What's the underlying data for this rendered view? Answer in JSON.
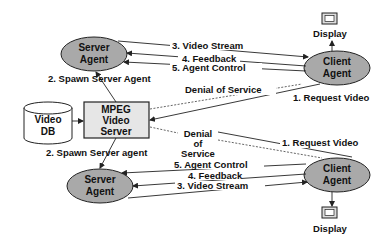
{
  "diagram": {
    "nodes": {
      "server_agent_top": {
        "line1": "Server",
        "line2": "Agent"
      },
      "client_agent_top": {
        "line1": "Client",
        "line2": "Agent"
      },
      "server_agent_bottom": {
        "line1": "Server",
        "line2": "Agent"
      },
      "client_agent_bottom": {
        "line1": "Client",
        "line2": "Agent"
      },
      "mpeg_server": {
        "line1": "MPEG",
        "line2": "Video",
        "line3": "Server"
      },
      "video_db": {
        "line1": "Video",
        "line2": "DB"
      },
      "display_top": {
        "label": "Display"
      },
      "display_bottom": {
        "label": "Display"
      }
    },
    "edges_top": {
      "video_stream": "3. Video Stream",
      "feedback": "4. Feedback",
      "agent_control": "5. Agent Control",
      "spawn": "2. Spawn Server Agent",
      "denial": "Denial of Service",
      "request": "1. Request Video"
    },
    "edges_bottom": {
      "video_stream": "3. Video Stream",
      "feedback": "4. Feedback",
      "agent_control": "5. Agent Control",
      "spawn": "2. Spawn Server agent",
      "denial_1": "Denial",
      "denial_2": "of",
      "denial_3": "Service",
      "request": "1. Request Video"
    },
    "colors": {
      "ellipse_fill": "#a9a9a9",
      "box_fill": "#e6e6e6",
      "stroke": "#222222"
    }
  }
}
